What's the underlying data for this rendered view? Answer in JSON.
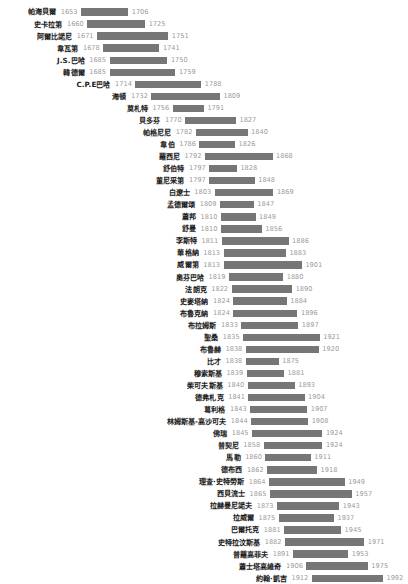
{
  "chart_data": {
    "type": "bar",
    "title": "",
    "subtitle": "",
    "xlabel": "",
    "ylabel": "",
    "orientation": "horizontal",
    "style": "timeline-lifespan-gantt",
    "grid": false,
    "legend": null,
    "xlim": [
      1650,
      1995
    ],
    "bar_color": "#767676",
    "name_color": "#1a1a1a",
    "year_color": "#9b9b9b",
    "categories": [
      "帕海貝爾",
      "史卡拉第",
      "阿爾比諾尼",
      "韋瓦第",
      "J.S.巴哈",
      "韓德爾",
      "C.P.E巴哈",
      "海頓",
      "莫札特",
      "貝多芬",
      "帕格尼尼",
      "韋伯",
      "羅西尼",
      "舒伯特",
      "董尼采第",
      "白遼士",
      "孟德爾頌",
      "蕭邦",
      "舒曼",
      "李斯特",
      "華格納",
      "威爾第",
      "奧芬巴哈",
      "法朗克",
      "史麥塔納",
      "布魯克納",
      "布拉姆斯",
      "聖桑",
      "布魯赫",
      "比才",
      "穆索斯基",
      "柴可夫斯基",
      "德弗札克",
      "葛利格",
      "林姆斯基-高沙可夫",
      "佛瑞",
      "普契尼",
      "馬勒",
      "德布西",
      "理查·史特勞斯",
      "西貝流士",
      "拉赫曼尼諾夫",
      "拉威爾",
      "巴爾托克",
      "史特拉汶斯基",
      "普羅高菲夫",
      "蕭士塔高維奇",
      "約翰·凱吉"
    ],
    "start_values": [
      1653,
      1660,
      1671,
      1678,
      1685,
      1685,
      1714,
      1732,
      1756,
      1770,
      1782,
      1786,
      1792,
      1797,
      1797,
      1803,
      1809,
      1810,
      1810,
      1811,
      1813,
      1813,
      1819,
      1822,
      1824,
      1824,
      1833,
      1835,
      1838,
      1838,
      1839,
      1840,
      1841,
      1843,
      1844,
      1845,
      1858,
      1860,
      1862,
      1864,
      1865,
      1873,
      1875,
      1881,
      1882,
      1891,
      1906,
      1912
    ],
    "end_values": [
      1706,
      1725,
      1751,
      1741,
      1750,
      1759,
      1788,
      1809,
      1791,
      1827,
      1840,
      1826,
      1868,
      1828,
      1848,
      1869,
      1847,
      1849,
      1856,
      1886,
      1883,
      1901,
      1880,
      1890,
      1884,
      1896,
      1897,
      1921,
      1920,
      1875,
      1881,
      1893,
      1904,
      1907,
      1908,
      1924,
      1924,
      1911,
      1918,
      1949,
      1957,
      1943,
      1937,
      1945,
      1971,
      1953,
      1975,
      1992
    ],
    "rows": [
      {
        "name": "帕海貝爾",
        "start": 1653,
        "end": 1706,
        "start_label": "1653",
        "end_label": "1706"
      },
      {
        "name": "史卡拉第",
        "start": 1660,
        "end": 1725,
        "start_label": "1660",
        "end_label": "1725"
      },
      {
        "name": "阿爾比諾尼",
        "start": 1671,
        "end": 1751,
        "start_label": "1671",
        "end_label": "1751"
      },
      {
        "name": "韋瓦第",
        "start": 1678,
        "end": 1741,
        "start_label": "1678",
        "end_label": "1741"
      },
      {
        "name": "J.S.巴哈",
        "start": 1685,
        "end": 1750,
        "start_label": "1685",
        "end_label": "1750"
      },
      {
        "name": "韓德爾",
        "start": 1685,
        "end": 1759,
        "start_label": "1685",
        "end_label": "1759"
      },
      {
        "name": "C.P.E巴哈",
        "start": 1714,
        "end": 1788,
        "start_label": "1714",
        "end_label": "1788"
      },
      {
        "name": "海頓",
        "start": 1732,
        "end": 1809,
        "start_label": "1732",
        "end_label": "1809"
      },
      {
        "name": "莫札特",
        "start": 1756,
        "end": 1791,
        "start_label": "1756",
        "end_label": "1791"
      },
      {
        "name": "貝多芬",
        "start": 1770,
        "end": 1827,
        "start_label": "1770",
        "end_label": "1827"
      },
      {
        "name": "帕格尼尼",
        "start": 1782,
        "end": 1840,
        "start_label": "1782",
        "end_label": "1840"
      },
      {
        "name": "韋伯",
        "start": 1786,
        "end": 1826,
        "start_label": "1786",
        "end_label": "1826"
      },
      {
        "name": "羅西尼",
        "start": 1792,
        "end": 1868,
        "start_label": "1792",
        "end_label": "1868"
      },
      {
        "name": "舒伯特",
        "start": 1797,
        "end": 1828,
        "start_label": "1797",
        "end_label": "1828"
      },
      {
        "name": "董尼采第",
        "start": 1797,
        "end": 1848,
        "start_label": "1797",
        "end_label": "1848"
      },
      {
        "name": "白遼士",
        "start": 1803,
        "end": 1869,
        "start_label": "1803",
        "end_label": "1869"
      },
      {
        "name": "孟德爾頌",
        "start": 1809,
        "end": 1847,
        "start_label": "1809",
        "end_label": "1847"
      },
      {
        "name": "蕭邦",
        "start": 1810,
        "end": 1849,
        "start_label": "1810",
        "end_label": "1849"
      },
      {
        "name": "舒曼",
        "start": 1810,
        "end": 1856,
        "start_label": "1810",
        "end_label": "1856"
      },
      {
        "name": "李斯特",
        "start": 1811,
        "end": 1886,
        "start_label": "1811",
        "end_label": "1886"
      },
      {
        "name": "華格納",
        "start": 1813,
        "end": 1883,
        "start_label": "1813",
        "end_label": "1883"
      },
      {
        "name": "威爾第",
        "start": 1813,
        "end": 1901,
        "start_label": "1813",
        "end_label": "1901"
      },
      {
        "name": "奧芬巴哈",
        "start": 1819,
        "end": 1880,
        "start_label": "1819",
        "end_label": "1880"
      },
      {
        "name": "法朗克",
        "start": 1822,
        "end": 1890,
        "start_label": "1822",
        "end_label": "1890"
      },
      {
        "name": "史麥塔納",
        "start": 1824,
        "end": 1884,
        "start_label": "1824",
        "end_label": "1884"
      },
      {
        "name": "布魯克納",
        "start": 1824,
        "end": 1896,
        "start_label": "1824",
        "end_label": "1896"
      },
      {
        "name": "布拉姆斯",
        "start": 1833,
        "end": 1897,
        "start_label": "1833",
        "end_label": "1897"
      },
      {
        "name": "聖桑",
        "start": 1835,
        "end": 1921,
        "start_label": "1835",
        "end_label": "1921"
      },
      {
        "name": "布魯赫",
        "start": 1838,
        "end": 1920,
        "start_label": "1838",
        "end_label": "1920"
      },
      {
        "name": "比才",
        "start": 1838,
        "end": 1875,
        "start_label": "1838",
        "end_label": "1875"
      },
      {
        "name": "穆索斯基",
        "start": 1839,
        "end": 1881,
        "start_label": "1839",
        "end_label": "1881"
      },
      {
        "name": "柴可夫斯基",
        "start": 1840,
        "end": 1893,
        "start_label": "1840",
        "end_label": "1893"
      },
      {
        "name": "德弗札克",
        "start": 1841,
        "end": 1904,
        "start_label": "1841",
        "end_label": "1904"
      },
      {
        "name": "葛利格",
        "start": 1843,
        "end": 1907,
        "start_label": "1843",
        "end_label": "1907"
      },
      {
        "name": "林姆斯基-高沙可夫",
        "start": 1844,
        "end": 1908,
        "start_label": "1844",
        "end_label": "1908"
      },
      {
        "name": "佛瑞",
        "start": 1845,
        "end": 1924,
        "start_label": "1845",
        "end_label": "1924"
      },
      {
        "name": "普契尼",
        "start": 1858,
        "end": 1924,
        "start_label": "1858",
        "end_label": "1924"
      },
      {
        "name": "馬勒",
        "start": 1860,
        "end": 1911,
        "start_label": "1860",
        "end_label": "1911"
      },
      {
        "name": "德布西",
        "start": 1862,
        "end": 1918,
        "start_label": "1862",
        "end_label": "1918"
      },
      {
        "name": "理查·史特勞斯",
        "start": 1864,
        "end": 1949,
        "start_label": "1864",
        "end_label": "1949"
      },
      {
        "name": "西貝流士",
        "start": 1865,
        "end": 1957,
        "start_label": "1865",
        "end_label": "1957"
      },
      {
        "name": "拉赫曼尼諾夫",
        "start": 1873,
        "end": 1943,
        "start_label": "1873",
        "end_label": "1943"
      },
      {
        "name": "拉威爾",
        "start": 1875,
        "end": 1937,
        "start_label": "1875",
        "end_label": "1937"
      },
      {
        "name": "巴爾托克",
        "start": 1881,
        "end": 1945,
        "start_label": "1881",
        "end_label": "1945"
      },
      {
        "name": "史特拉汶斯基",
        "start": 1882,
        "end": 1971,
        "start_label": "1882",
        "end_label": "1971"
      },
      {
        "name": "普羅高菲夫",
        "start": 1891,
        "end": 1953,
        "start_label": "1891",
        "end_label": "1953"
      },
      {
        "name": "蕭士塔高維奇",
        "start": 1906,
        "end": 1975,
        "start_label": "1906",
        "end_label": "1975"
      },
      {
        "name": "約翰·凱吉",
        "start": 1912,
        "end": 1992,
        "start_label": "1912",
        "end_label": "1992"
      }
    ]
  }
}
